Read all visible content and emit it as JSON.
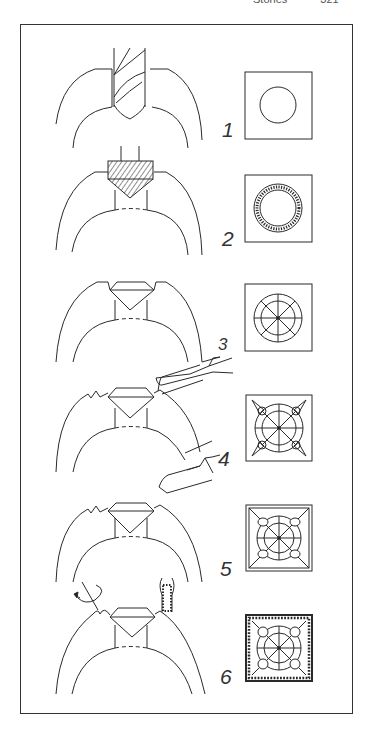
{
  "running_head": {
    "title": "Stones",
    "page": "321"
  },
  "figure": {
    "steps": [
      {
        "number": "1",
        "tool": "drill",
        "plan_view": "circle-hole"
      },
      {
        "number": "2",
        "tool": "setting-burr",
        "plan_view": "burred-seat"
      },
      {
        "number": "3",
        "tool": "none",
        "plan_view": "stone-set"
      },
      {
        "number": "4",
        "tool": "graver",
        "plan_view": "corners-raised"
      },
      {
        "number": "5",
        "tool": "graver",
        "plan_view": "beads-formed"
      },
      {
        "number": "6",
        "tool": "beading-tool-and-millgrain",
        "plan_view": "millgrain-border"
      }
    ]
  }
}
